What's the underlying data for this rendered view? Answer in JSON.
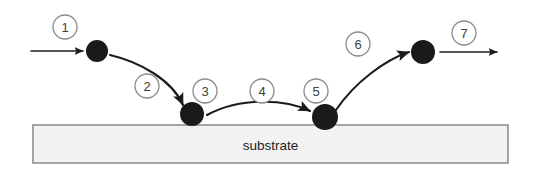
{
  "figure": {
    "type": "process-diagram",
    "title": "",
    "background_color": "#ffffff"
  },
  "substrate": {
    "label": "substrate",
    "fill_color": "#f2f2f2",
    "border_color": "#808080",
    "text_color": "#1c1c1c",
    "x": 33,
    "y": 125,
    "width": 475,
    "height": 38
  },
  "particles": {
    "color": "#1a1a1a",
    "items": [
      {
        "name": "incoming-adatom",
        "cx": 97,
        "cy": 51,
        "r": 11
      },
      {
        "name": "adsorbed-adatom",
        "cx": 192,
        "cy": 114,
        "r": 12
      },
      {
        "name": "diffused-adatom",
        "cx": 325,
        "cy": 117,
        "r": 13
      },
      {
        "name": "desorbed-adatom",
        "cx": 423,
        "cy": 52,
        "r": 12
      }
    ]
  },
  "steps": {
    "badge_stroke_color": "#8c8c8c",
    "badge_fill_color": "#ffffff",
    "badge_text_color": "#3d3d3d",
    "items": [
      {
        "label": "1",
        "cx": 65,
        "cy": 27,
        "r": 12,
        "name": "step-badge-1"
      },
      {
        "label": "2",
        "cx": 147,
        "cy": 86,
        "r": 12,
        "name": "step-badge-2"
      },
      {
        "label": "3",
        "cx": 205,
        "cy": 91,
        "r": 12,
        "name": "step-badge-3"
      },
      {
        "label": "4",
        "cx": 262,
        "cy": 91,
        "r": 12,
        "name": "step-badge-4"
      },
      {
        "label": "5",
        "cx": 316,
        "cy": 91,
        "r": 12,
        "name": "step-badge-5"
      },
      {
        "label": "6",
        "cx": 358,
        "cy": 44,
        "r": 12,
        "name": "step-badge-6"
      },
      {
        "label": "7",
        "cx": 464,
        "cy": 33,
        "r": 12,
        "name": "step-badge-7"
      }
    ]
  },
  "arrows": {
    "color": "#1c1c1c",
    "items": [
      {
        "name": "arrow-incident-flux",
        "kind": "straight",
        "path": "M 31 51 L 83 51"
      },
      {
        "name": "arrow-adsorption",
        "kind": "curved",
        "path": "M 110 55 C 140 62 172 80 183 105"
      },
      {
        "name": "arrow-surface-diffusion",
        "kind": "curved",
        "path": "M 207 115 C 240 97 285 99 310 111"
      },
      {
        "name": "arrow-desorption",
        "kind": "curved",
        "path": "M 336 110 C 355 82 385 60 409 52"
      },
      {
        "name": "arrow-outgoing-flux",
        "kind": "straight",
        "path": "M 440 52 L 497 52"
      }
    ]
  }
}
